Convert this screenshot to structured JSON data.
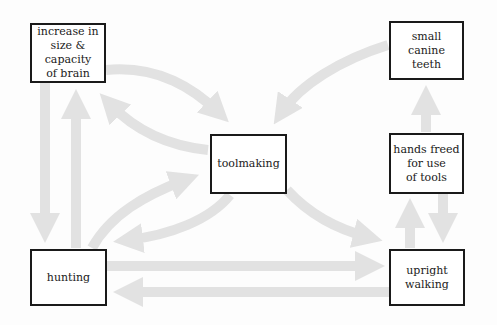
{
  "diagram": {
    "nodes": [
      {
        "id": "brain",
        "label": "increase in\nsize &\ncapacity\nof brain"
      },
      {
        "id": "canine",
        "label": "small\ncanine teeth"
      },
      {
        "id": "toolmaking",
        "label": "toolmaking"
      },
      {
        "id": "hands",
        "label": "hands freed\nfor use\nof tools"
      },
      {
        "id": "hunting",
        "label": "hunting"
      },
      {
        "id": "upright",
        "label": "upright\nwalking"
      }
    ],
    "edges": [
      {
        "from": "brain",
        "to": "toolmaking"
      },
      {
        "from": "toolmaking",
        "to": "brain"
      },
      {
        "from": "canine",
        "to": "toolmaking"
      },
      {
        "from": "brain",
        "to": "hunting"
      },
      {
        "from": "hunting",
        "to": "brain"
      },
      {
        "from": "hunting",
        "to": "toolmaking"
      },
      {
        "from": "toolmaking",
        "to": "hunting"
      },
      {
        "from": "toolmaking",
        "to": "upright"
      },
      {
        "from": "hunting",
        "to": "upright"
      },
      {
        "from": "upright",
        "to": "hunting"
      },
      {
        "from": "upright",
        "to": "hands"
      },
      {
        "from": "hands",
        "to": "upright"
      },
      {
        "from": "hands",
        "to": "canine"
      }
    ],
    "arrow_color": "#e2e2e2",
    "border_color": "#1a1a1a"
  }
}
